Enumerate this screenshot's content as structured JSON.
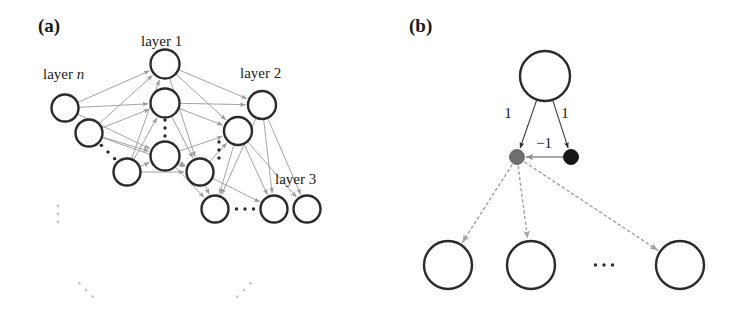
{
  "figure": {
    "width": 742,
    "height": 323,
    "background": "#ffffff"
  },
  "panels": [
    {
      "id": "panel-a",
      "label": "(a)",
      "label_pos": [
        38,
        32
      ],
      "caption_labels": [
        {
          "name": "layer-n-label",
          "text_plain": "layer ",
          "text_italic": "n",
          "x": 43,
          "y": 79
        },
        {
          "name": "layer-1-label",
          "text_plain": "layer 1",
          "text_italic": "",
          "x": 141,
          "y": 46
        },
        {
          "name": "layer-2-label",
          "text_plain": "layer 2",
          "text_italic": "",
          "x": 240,
          "y": 78
        },
        {
          "name": "layer-3-label",
          "text_plain": "layer 3",
          "text_italic": "",
          "x": 275,
          "y": 184
        }
      ],
      "nodes": [
        {
          "name": "node-layer-n-1",
          "x": 65,
          "y": 108,
          "r": 13.5,
          "style": "hollow"
        },
        {
          "name": "node-layer-n-2",
          "x": 89,
          "y": 133,
          "r": 13.5,
          "style": "hollow"
        },
        {
          "name": "node-layer-n-3",
          "x": 127,
          "y": 172,
          "r": 13.5,
          "style": "hollow"
        },
        {
          "name": "node-layer-1-1",
          "x": 165,
          "y": 64,
          "r": 14.5,
          "style": "hollow"
        },
        {
          "name": "node-layer-1-2",
          "x": 165,
          "y": 103,
          "r": 14.5,
          "style": "hollow"
        },
        {
          "name": "node-layer-1-3",
          "x": 165,
          "y": 156,
          "r": 14.5,
          "style": "hollow"
        },
        {
          "name": "node-layer-1-4",
          "x": 200,
          "y": 172,
          "r": 13.5,
          "style": "hollow"
        },
        {
          "name": "node-layer-2-1",
          "x": 262,
          "y": 105,
          "r": 14.0,
          "style": "hollow"
        },
        {
          "name": "node-layer-2-2",
          "x": 238,
          "y": 131,
          "r": 14.0,
          "style": "hollow"
        },
        {
          "name": "node-layer-3-1",
          "x": 215,
          "y": 209,
          "r": 13.5,
          "style": "hollow"
        },
        {
          "name": "node-layer-3-2",
          "x": 274,
          "y": 209,
          "r": 13.5,
          "style": "hollow"
        },
        {
          "name": "node-layer-3-3",
          "x": 307,
          "y": 209,
          "r": 13.5,
          "style": "hollow"
        }
      ],
      "ellipses_dots": [
        {
          "name": "ellipsis-layer-n",
          "kind": "diagonal-down",
          "x": 108,
          "y": 152,
          "count": 3,
          "faint": false
        },
        {
          "name": "ellipsis-layer-1",
          "kind": "vertical",
          "x": 165,
          "y": 128,
          "count": 3,
          "faint": false
        },
        {
          "name": "ellipsis-layer-2",
          "kind": "vertical",
          "x": 219,
          "y": 150,
          "count": 3,
          "faint": false
        },
        {
          "name": "ellipsis-layer-3",
          "kind": "horizontal",
          "x": 245,
          "y": 209,
          "count": 3,
          "faint": false
        },
        {
          "name": "ellipsis-left-column",
          "kind": "vertical",
          "x": 58,
          "y": 214,
          "count": 3,
          "faint": true
        },
        {
          "name": "ellipsis-bottom-left",
          "kind": "diagonal-down",
          "x": 86,
          "y": 290,
          "count": 3,
          "faint": true
        },
        {
          "name": "ellipsis-bottom-right",
          "kind": "diagonal-up",
          "x": 244,
          "y": 290,
          "count": 3,
          "faint": true
        }
      ],
      "edges": [
        [
          "node-layer-n-1",
          "node-layer-1-1"
        ],
        [
          "node-layer-n-1",
          "node-layer-1-2"
        ],
        [
          "node-layer-n-1",
          "node-layer-1-3"
        ],
        [
          "node-layer-n-2",
          "node-layer-1-1"
        ],
        [
          "node-layer-n-2",
          "node-layer-1-2"
        ],
        [
          "node-layer-n-2",
          "node-layer-1-3"
        ],
        [
          "node-layer-n-2",
          "node-layer-1-4"
        ],
        [
          "node-layer-n-3",
          "node-layer-1-1"
        ],
        [
          "node-layer-n-3",
          "node-layer-1-2"
        ],
        [
          "node-layer-n-3",
          "node-layer-1-3"
        ],
        [
          "node-layer-n-3",
          "node-layer-1-4"
        ],
        [
          "node-layer-1-1",
          "node-layer-2-1"
        ],
        [
          "node-layer-1-1",
          "node-layer-2-2"
        ],
        [
          "node-layer-1-1",
          "node-layer-1-4"
        ],
        [
          "node-layer-1-2",
          "node-layer-2-1"
        ],
        [
          "node-layer-1-2",
          "node-layer-2-2"
        ],
        [
          "node-layer-1-2",
          "node-layer-1-4"
        ],
        [
          "node-layer-1-3",
          "node-layer-2-2"
        ],
        [
          "node-layer-1-3",
          "node-layer-1-4"
        ],
        [
          "node-layer-1-3",
          "node-layer-3-1"
        ],
        [
          "node-layer-1-4",
          "node-layer-3-1"
        ],
        [
          "node-layer-1-4",
          "node-layer-3-2"
        ],
        [
          "node-layer-1-4",
          "node-layer-2-2"
        ],
        [
          "node-layer-2-1",
          "node-layer-3-1"
        ],
        [
          "node-layer-2-1",
          "node-layer-3-2"
        ],
        [
          "node-layer-2-1",
          "node-layer-3-3"
        ],
        [
          "node-layer-2-2",
          "node-layer-3-1"
        ],
        [
          "node-layer-2-2",
          "node-layer-3-2"
        ],
        [
          "node-layer-2-2",
          "node-layer-3-3"
        ]
      ]
    },
    {
      "id": "panel-b",
      "label": "(b)",
      "label_pos": [
        409,
        32
      ],
      "nodes": [
        {
          "name": "node-parent",
          "x": 545,
          "y": 76,
          "r": 25,
          "style": "hollow"
        },
        {
          "name": "node-child-gray",
          "x": 517,
          "y": 157,
          "r": 7.5,
          "style": "filled-gray"
        },
        {
          "name": "node-child-black",
          "x": 571,
          "y": 157,
          "r": 7.5,
          "style": "filled-black"
        },
        {
          "name": "node-leaf-1",
          "x": 448,
          "y": 265,
          "r": 24,
          "style": "hollow"
        },
        {
          "name": "node-leaf-2",
          "x": 531,
          "y": 265,
          "r": 24,
          "style": "hollow"
        },
        {
          "name": "node-leaf-3",
          "x": 680,
          "y": 265,
          "r": 24,
          "style": "hollow"
        }
      ],
      "ellipses_dots": [
        {
          "name": "ellipsis-leaf-row",
          "kind": "horizontal",
          "x": 604,
          "y": 265,
          "count": 3,
          "faint": false
        }
      ],
      "weight_labels": [
        {
          "name": "weight-left-label",
          "text": "1",
          "x": 508,
          "y": 118
        },
        {
          "name": "weight-right-label",
          "text": "1",
          "x": 565,
          "y": 118
        },
        {
          "name": "weight-lateral-label",
          "text": "−1",
          "x": 544,
          "y": 148
        }
      ],
      "edges_solid": [
        {
          "name": "edge-parent-to-gray",
          "from": "node-parent",
          "to": "node-child-gray"
        },
        {
          "name": "edge-parent-to-black",
          "from": "node-parent",
          "to": "node-child-black"
        }
      ],
      "edges_lateral": [
        {
          "name": "edge-black-to-gray",
          "from": "node-child-black",
          "to": "node-child-gray"
        }
      ],
      "edges_dotted": [
        {
          "name": "edge-gray-to-leaf-1",
          "from": "node-child-gray",
          "to": "node-leaf-1"
        },
        {
          "name": "edge-gray-to-leaf-2",
          "from": "node-child-gray",
          "to": "node-leaf-2"
        },
        {
          "name": "edge-gray-to-leaf-3",
          "from": "node-child-gray",
          "to": "node-leaf-3"
        }
      ]
    }
  ],
  "colors": {
    "node_stroke": "#2b2b2b",
    "edge_gray": "#9a9a9a",
    "edge_dark": "#3a3a3a",
    "filled_gray": "#6e6e6e",
    "filled_black": "#151515",
    "text": "#1a1a1a"
  }
}
